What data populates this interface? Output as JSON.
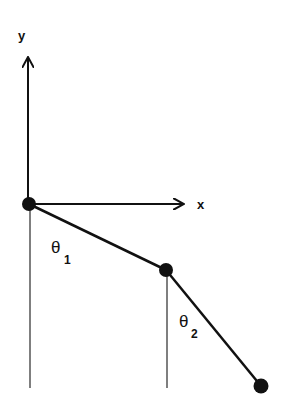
{
  "diagram": {
    "axes": {
      "x_label": "x",
      "y_label": "y"
    },
    "angles": [
      {
        "symbol": "θ",
        "subscript": "1"
      },
      {
        "symbol": "θ",
        "subscript": "2"
      }
    ],
    "points": {
      "pivot": [
        29,
        204
      ],
      "mass1": [
        166,
        270
      ],
      "mass2": [
        261,
        386
      ]
    },
    "colors": {
      "ink": "#111111",
      "reference_line": "#555555",
      "background": "#ffffff"
    }
  }
}
